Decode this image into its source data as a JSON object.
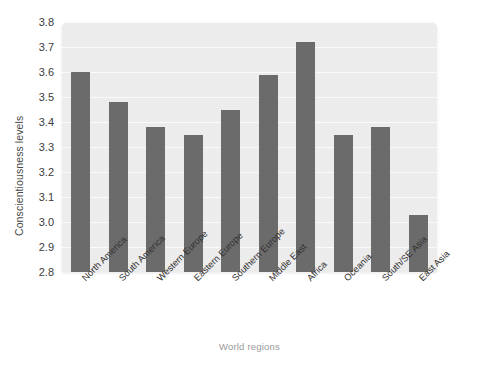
{
  "chart_data": {
    "type": "bar",
    "title": "",
    "xlabel": "World regions",
    "ylabel": "Conscientiousness levels",
    "categories": [
      "North America",
      "South America",
      "Western Europe",
      "Eastern Europe",
      "Southern Europe",
      "Middle East",
      "Africa",
      "Oceania",
      "South/SE Asia",
      "East Asia"
    ],
    "values": [
      3.6,
      3.48,
      3.38,
      3.35,
      3.45,
      3.59,
      3.72,
      3.35,
      3.38,
      3.03
    ],
    "ylim": [
      2.8,
      3.8
    ],
    "yticks": [
      "2.8",
      "2.9",
      "3.0",
      "3.1",
      "3.2",
      "3.3",
      "3.4",
      "3.5",
      "3.6",
      "3.7",
      "3.8"
    ],
    "ytick_values": [
      2.8,
      2.9,
      3.0,
      3.1,
      3.2,
      3.3,
      3.4,
      3.5,
      3.6,
      3.7,
      3.8
    ],
    "grid": true,
    "legend": "none",
    "bar_color": "#6b6b6b",
    "plot_background_color": "#ececec",
    "gridline_color": "#fafafa",
    "figure_background_color": "#ffffff",
    "xtick_rotation": -45
  }
}
